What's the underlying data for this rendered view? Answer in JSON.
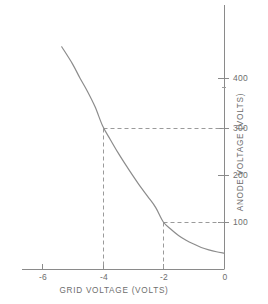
{
  "chart_data": {
    "type": "line",
    "title": "",
    "subtitle": "",
    "xlabel": "GRID VOLTAGE (VOLTS)",
    "ylabel": "ANODE VOLTAGE (VOLTS)",
    "xlim": [
      -7.0,
      0.0
    ],
    "ylim": [
      0,
      470
    ],
    "xticks": [
      -6,
      -4,
      -2,
      0
    ],
    "xtick_labels": [
      "-6",
      "-4",
      "-2",
      "0"
    ],
    "yticks": [
      100,
      200,
      300,
      400
    ],
    "ytick_labels": [
      "100",
      "200",
      "300",
      "400"
    ],
    "grid": false,
    "legend": null,
    "series": [
      {
        "name": "anode voltage vs grid voltage",
        "color": "#8c8c8c",
        "x": [
          -5.35,
          -5.0,
          -4.75,
          -4.5,
          -4.25,
          -4.0,
          -3.75,
          -3.5,
          -3.25,
          -3.0,
          -2.75,
          -2.5,
          -2.25,
          -2.0,
          -1.75,
          -1.5,
          -1.25,
          -1.0,
          -0.75,
          -0.5,
          -0.25,
          0.0
        ],
        "y": [
          465,
          430,
          400,
          372,
          340,
          300,
          272,
          245,
          220,
          196,
          173,
          152,
          130,
          100,
          85,
          72,
          62,
          54,
          47,
          42,
          38,
          35
        ]
      }
    ],
    "annotations": [
      {
        "name": "construction-line-300",
        "type": "dashed-guide",
        "x": -4,
        "y": 300,
        "label": "-4 V grid maps to 300 V anode"
      },
      {
        "name": "construction-line-100",
        "type": "dashed-guide",
        "x": -2,
        "y": 100,
        "label": "-2 V grid maps to 100 V anode"
      }
    ],
    "colors": {
      "curve": "#8c8c8c",
      "axis": "#8a8a8a",
      "dashed": "#9a9a9a",
      "text": "#6e6e6e",
      "background": "#ffffff"
    }
  },
  "axes": {
    "x_title": "GRID VOLTAGE (VOLTS)",
    "y_title": "ANODE VOLTAGE (VOLTS)",
    "x_ticks": [
      {
        "label": "-6",
        "px": 42
      },
      {
        "label": "-4",
        "px": 103
      },
      {
        "label": "-2",
        "px": 163
      },
      {
        "label": "0",
        "px": 224
      }
    ],
    "y_ticks": [
      {
        "label": "400",
        "px": 78
      },
      {
        "label": "300",
        "px": 128
      },
      {
        "label": "200",
        "px": 175
      },
      {
        "label": "100",
        "px": 222
      }
    ]
  }
}
